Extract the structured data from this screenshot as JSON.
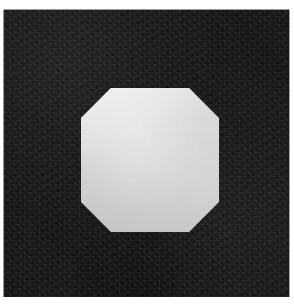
{
  "image": {
    "kind": "photograph",
    "subject": "octagon-shape-card",
    "width": 294,
    "height": 304,
    "background_color": "#ffffff",
    "alt_text": "A dark near-black square card photographed on a white surface, with a light gray octagon shape in the center."
  },
  "panel": {
    "name": "dark-square-panel",
    "color": "#141414",
    "left": 4,
    "top": 10,
    "width": 285,
    "height": 287,
    "texture": "matte noisy black cardstock"
  },
  "shape": {
    "name": "octagon",
    "sides": 8,
    "color": "#d9d9d7",
    "center_x": 146,
    "center_y": 150,
    "left": 77,
    "top": 78,
    "right": 215,
    "bottom": 222,
    "width": 138,
    "height": 144,
    "corner_cut": 30,
    "label": "Octagon"
  },
  "labels": {
    "title": "Octagon",
    "caption": "Light gray octagon on a black square background"
  }
}
